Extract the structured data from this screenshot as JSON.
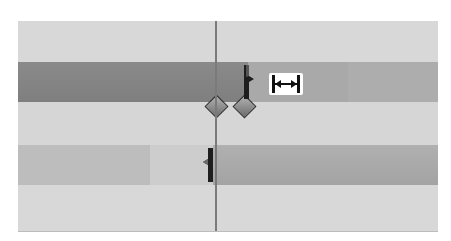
{
  "timeline": {
    "tracks": [
      {
        "id": "track-1",
        "type": "empty",
        "color": "#d8d8d8"
      },
      {
        "id": "track-2",
        "type": "clips",
        "clips": [
          {
            "name": "clip-a",
            "start": 0,
            "end": 230,
            "color": "#8c8c8c"
          },
          {
            "name": "clip-b",
            "start": 230,
            "end": 330,
            "color": "#a8a8a8"
          },
          {
            "name": "clip-c",
            "start": 330,
            "end": 420,
            "color": "#ababab"
          }
        ]
      },
      {
        "id": "track-3",
        "type": "keyframes",
        "keyframes": [
          {
            "name": "keyframe-1",
            "x": 197
          },
          {
            "name": "keyframe-2",
            "x": 225
          }
        ]
      },
      {
        "id": "track-4",
        "type": "clips",
        "clips": [
          {
            "name": "clip-d",
            "start": 0,
            "end": 130,
            "color": "#bcbcbc"
          },
          {
            "name": "clip-e",
            "start": 130,
            "end": 195,
            "color": "#cfcfcf"
          },
          {
            "name": "clip-f",
            "start": 195,
            "end": 420,
            "color": "#a9a9a9"
          }
        ]
      },
      {
        "id": "track-5",
        "type": "empty",
        "color": "#d8d8d8"
      }
    ],
    "playhead_x": 197,
    "cursor": "ripple-trim-cursor-icon"
  }
}
